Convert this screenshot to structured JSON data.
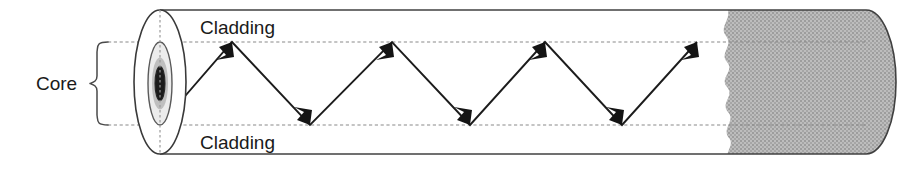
{
  "figure": {
    "type": "diagram",
    "width": 907,
    "height": 170,
    "background_color": "#ffffff"
  },
  "labels": {
    "cladding_top": "Cladding",
    "cladding_bottom": "Cladding",
    "core": "Core"
  },
  "colors": {
    "line": "#404040",
    "dashed_guide": "#8a8a8a",
    "ray": "#1c1c1c",
    "shaded_fill": "#b0b0b0",
    "core_fill": "#1b1b1b",
    "cladding_fill": "#ececec",
    "text": "#1a1a1a",
    "background": "#ffffff"
  },
  "geometry": {
    "cylinder": {
      "top_edge_y": 10,
      "bottom_edge_y": 154,
      "left_x": 135,
      "right_x": 866,
      "cap_rx": 30
    },
    "core_boundaries": {
      "top_y": 42,
      "bottom_y": 125
    },
    "face_ellipse": {
      "cx": 160,
      "cy": 82,
      "rx": 26,
      "ry": 72
    },
    "cladding_ellipse": {
      "cx": 160,
      "cy": 83.5,
      "rx": 12,
      "ry": 41.5
    },
    "core_ellipse": {
      "cx": 160,
      "cy": 83.5,
      "rx": 5,
      "ry": 17
    },
    "shaded_region": {
      "start_x": 724,
      "end_x": 896,
      "edge_style": "wavy"
    },
    "brace": {
      "x": 90,
      "top_y": 42,
      "bottom_y": 125,
      "tip_x": 108
    }
  },
  "ray_path": {
    "description": "Total internal reflection zigzag bouncing between core boundaries",
    "points": [
      {
        "x": 160,
        "y": 125
      },
      {
        "x": 232,
        "y": 42
      },
      {
        "x": 310,
        "y": 125
      },
      {
        "x": 392,
        "y": 42
      },
      {
        "x": 470,
        "y": 125
      },
      {
        "x": 545,
        "y": 42
      },
      {
        "x": 622,
        "y": 125
      },
      {
        "x": 697,
        "y": 42
      }
    ],
    "arrowhead_count": 7,
    "arrowheads_at": [
      1,
      2,
      3,
      4,
      5,
      6,
      7
    ]
  }
}
